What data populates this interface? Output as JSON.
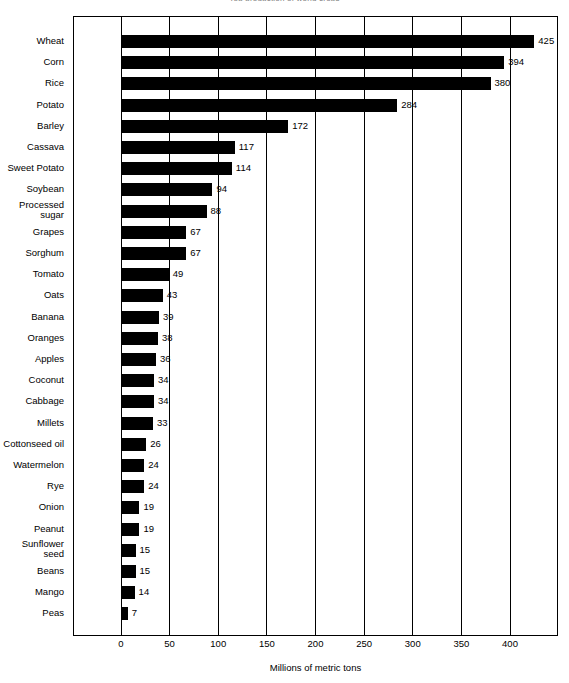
{
  "chart_data": {
    "type": "bar",
    "orientation": "horizontal",
    "title": "Top production of world crops",
    "xlabel": "Millions of metric tons",
    "ylabel": "",
    "xlim": [
      0,
      440
    ],
    "xticks": [
      0,
      50,
      100,
      150,
      200,
      250,
      300,
      350,
      400
    ],
    "xticklabels": [
      "0",
      "50",
      "100",
      "150",
      "200",
      "250",
      "300",
      "350",
      "400"
    ],
    "grid": true,
    "grid_axis": "x",
    "legend": "none",
    "bar_color": "#000000",
    "background_color": "#ffffff",
    "categories": [
      "Wheat",
      "Corn",
      "Rice",
      "Potato",
      "Barley",
      "Cassava",
      "Sweet Potato",
      "Soybean",
      "Processed\nsugar",
      "Grapes",
      "Sorghum",
      "Tomato",
      "Oats",
      "Banana",
      "Oranges",
      "Apples",
      "Coconut",
      "Cabbage",
      "Millets",
      "Cottonseed oil",
      "Watermelon",
      "Rye",
      "Onion",
      "Peanut",
      "Sunflower\nseed",
      "Beans",
      "Mango",
      "Peas"
    ],
    "values": [
      425,
      394,
      380,
      284,
      172,
      117,
      114,
      94,
      88,
      67,
      67,
      49,
      43,
      39,
      38,
      36,
      34,
      34,
      33,
      26,
      24,
      24,
      19,
      19,
      15,
      15,
      14,
      7
    ],
    "data_labels": [
      "425",
      "394",
      "380",
      "284",
      "172",
      "117",
      "114",
      "94",
      "88",
      "67",
      "67",
      "49",
      "43",
      "39",
      "38",
      "36",
      "34",
      "34",
      "33",
      "26",
      "24",
      "24",
      "19",
      "19",
      "15",
      "15",
      "14",
      "7"
    ]
  }
}
